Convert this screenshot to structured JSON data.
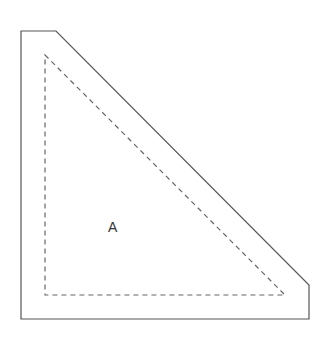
{
  "diagram": {
    "label": "A",
    "colors": {
      "outline": "#555555",
      "dashed": "#666666",
      "text": "#333333",
      "background": "#ffffff"
    },
    "outer_shape_points": "21,31 56,31 309,285 309,319 21,319",
    "inner_dashed_points": "45,55 285,295 45,295"
  }
}
